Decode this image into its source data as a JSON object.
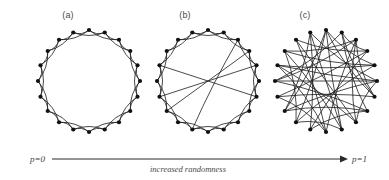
{
  "figure": {
    "caption_left": "p=0",
    "caption_right": "p=1",
    "caption_center": "increased randomness",
    "arrow_icon": "right-arrow-icon"
  },
  "panels": [
    {
      "label": "(a)",
      "name": "regular-lattice",
      "p": 0
    },
    {
      "label": "(b)",
      "name": "small-world",
      "p": 0.1
    },
    {
      "label": "(c)",
      "name": "random-graph",
      "p": 1
    }
  ],
  "chart_data": {
    "type": "diagram",
    "title": "",
    "subtitle": "",
    "diagram_kind": "watts-strogatz-rewiring",
    "nodes_per_ring": 20,
    "mean_degree_k": 4,
    "node_color": "#111111",
    "edge_color": "#1c1c1c",
    "node_radius_px": 2.1,
    "edge_width_px": 0.8,
    "edge_curvature": 0.32,
    "rings": [
      {
        "label": "(a)",
        "p": 0,
        "center": [
          89,
          81
        ],
        "radius": 51,
        "start_angle_deg": -90,
        "edges": [
          [
            0,
            1
          ],
          [
            1,
            2
          ],
          [
            2,
            3
          ],
          [
            3,
            4
          ],
          [
            4,
            5
          ],
          [
            5,
            6
          ],
          [
            6,
            7
          ],
          [
            7,
            8
          ],
          [
            8,
            9
          ],
          [
            9,
            10
          ],
          [
            10,
            11
          ],
          [
            11,
            12
          ],
          [
            12,
            13
          ],
          [
            13,
            14
          ],
          [
            14,
            15
          ],
          [
            15,
            16
          ],
          [
            16,
            17
          ],
          [
            17,
            18
          ],
          [
            18,
            19
          ],
          [
            19,
            0
          ],
          [
            0,
            2
          ],
          [
            1,
            3
          ],
          [
            2,
            4
          ],
          [
            3,
            5
          ],
          [
            4,
            6
          ],
          [
            5,
            7
          ],
          [
            6,
            8
          ],
          [
            7,
            9
          ],
          [
            8,
            10
          ],
          [
            9,
            11
          ],
          [
            10,
            12
          ],
          [
            11,
            13
          ],
          [
            12,
            14
          ],
          [
            13,
            15
          ],
          [
            14,
            16
          ],
          [
            15,
            17
          ],
          [
            16,
            18
          ],
          [
            17,
            19
          ],
          [
            18,
            0
          ],
          [
            19,
            1
          ]
        ]
      },
      {
        "label": "(b)",
        "p": 0.1,
        "center": [
          208,
          81
        ],
        "radius": 51,
        "start_angle_deg": -90,
        "edges": [
          [
            0,
            1
          ],
          [
            1,
            2
          ],
          [
            2,
            3
          ],
          [
            3,
            4
          ],
          [
            4,
            5
          ],
          [
            5,
            6
          ],
          [
            6,
            7
          ],
          [
            7,
            8
          ],
          [
            8,
            9
          ],
          [
            9,
            10
          ],
          [
            10,
            11
          ],
          [
            11,
            12
          ],
          [
            12,
            13
          ],
          [
            13,
            14
          ],
          [
            14,
            15
          ],
          [
            15,
            16
          ],
          [
            16,
            17
          ],
          [
            17,
            18
          ],
          [
            18,
            19
          ],
          [
            19,
            0
          ],
          [
            0,
            2
          ],
          [
            1,
            3
          ],
          [
            2,
            4
          ],
          [
            3,
            5
          ],
          [
            4,
            6
          ],
          [
            5,
            7
          ],
          [
            6,
            8
          ],
          [
            7,
            9
          ],
          [
            8,
            10
          ],
          [
            9,
            11
          ],
          [
            10,
            12
          ],
          [
            11,
            13
          ],
          [
            12,
            14
          ],
          [
            13,
            15
          ],
          [
            14,
            16
          ],
          [
            15,
            17
          ],
          [
            16,
            18
          ],
          [
            17,
            19
          ],
          [
            18,
            0
          ],
          [
            19,
            1
          ],
          [
            3,
            13
          ],
          [
            6,
            16
          ],
          [
            2,
            11
          ],
          [
            14,
            4
          ]
        ],
        "rewired_edges": [
          [
            3,
            13
          ],
          [
            6,
            16
          ],
          [
            2,
            11
          ],
          [
            14,
            4
          ]
        ]
      },
      {
        "label": "(c)",
        "p": 1,
        "center": [
          326,
          81
        ],
        "radius": 51,
        "start_angle_deg": -90,
        "edges": [
          [
            0,
            4
          ],
          [
            0,
            9
          ],
          [
            0,
            13
          ],
          [
            1,
            7
          ],
          [
            1,
            15
          ],
          [
            1,
            3
          ],
          [
            2,
            10
          ],
          [
            2,
            17
          ],
          [
            2,
            6
          ],
          [
            3,
            11
          ],
          [
            3,
            18
          ],
          [
            4,
            12
          ],
          [
            4,
            16
          ],
          [
            5,
            13
          ],
          [
            5,
            19
          ],
          [
            5,
            8
          ],
          [
            6,
            14
          ],
          [
            6,
            1
          ],
          [
            7,
            15
          ],
          [
            7,
            11
          ],
          [
            8,
            16
          ],
          [
            8,
            2
          ],
          [
            9,
            17
          ],
          [
            9,
            12
          ],
          [
            10,
            18
          ],
          [
            10,
            14
          ],
          [
            11,
            19
          ],
          [
            12,
            0
          ],
          [
            13,
            7
          ],
          [
            14,
            3
          ],
          [
            15,
            5
          ],
          [
            16,
            10
          ],
          [
            17,
            4
          ],
          [
            18,
            8
          ],
          [
            19,
            13
          ],
          [
            0,
            6
          ],
          [
            2,
            15
          ],
          [
            9,
            19
          ],
          [
            12,
            17
          ],
          [
            5,
            16
          ]
        ]
      }
    ],
    "annotations": [
      {
        "text": "p=0",
        "position": "left-of-arrow"
      },
      {
        "text": "increased randomness",
        "position": "below-arrow-center"
      },
      {
        "text": "p=1",
        "position": "right-of-arrow"
      }
    ],
    "arrow": {
      "x1": 52,
      "y1": 159,
      "x2": 348,
      "y2": 159,
      "color": "#2a2a2a"
    }
  }
}
